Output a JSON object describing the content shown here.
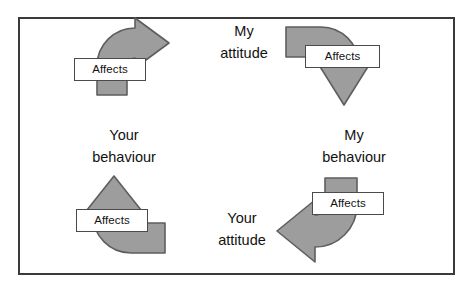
{
  "diagram": {
    "type": "cycle-diagram",
    "frame": {
      "border_color": "#3a3a3a",
      "background_color": "#ffffff"
    },
    "arrow_style": {
      "fill_color": "#9d9d9d",
      "stroke_color": "#5e5e5e"
    },
    "nodes": [
      {
        "id": "my-attitude",
        "line1": "My",
        "line2": "attitude",
        "position": "top-center"
      },
      {
        "id": "my-behaviour",
        "line1": "My",
        "line2": "behaviour",
        "position": "middle-right"
      },
      {
        "id": "your-attitude",
        "line1": "Your",
        "line2": "attitude",
        "position": "bottom-center"
      },
      {
        "id": "your-behaviour",
        "line1": "Your",
        "line2": "behaviour",
        "position": "middle-left"
      }
    ],
    "arrows": [
      {
        "id": "arrow-your-behaviour-to-my-attitude",
        "label": "Affects",
        "from": "your-behaviour",
        "to": "my-attitude",
        "direction": "up-right",
        "quadrant": "top-left"
      },
      {
        "id": "arrow-my-attitude-to-my-behaviour",
        "label": "Affects",
        "from": "my-attitude",
        "to": "my-behaviour",
        "direction": "right-down",
        "quadrant": "top-right"
      },
      {
        "id": "arrow-your-attitude-to-your-behaviour",
        "label": "Affects",
        "from": "your-attitude",
        "to": "your-behaviour",
        "direction": "left-up",
        "quadrant": "bottom-left"
      },
      {
        "id": "arrow-my-behaviour-to-your-attitude",
        "label": "Affects",
        "from": "my-behaviour",
        "to": "your-attitude",
        "direction": "down-left",
        "quadrant": "bottom-right"
      }
    ]
  }
}
